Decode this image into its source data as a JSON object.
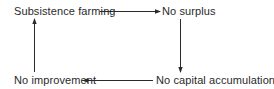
{
  "diagram": {
    "type": "cycle",
    "nodes": [
      {
        "id": "subsistence",
        "label": "Subsistence farming"
      },
      {
        "id": "surplus",
        "label": "No surplus"
      },
      {
        "id": "capital",
        "label": "No capital accumulation"
      },
      {
        "id": "improvement",
        "label": "No improvement"
      }
    ],
    "edges": [
      {
        "from": "subsistence",
        "to": "surplus"
      },
      {
        "from": "surplus",
        "to": "capital"
      },
      {
        "from": "capital",
        "to": "improvement"
      },
      {
        "from": "improvement",
        "to": "subsistence"
      }
    ],
    "colors": {
      "stroke": "#2a2a2a",
      "text": "#2a2a2a",
      "background": "#ffffff"
    }
  }
}
